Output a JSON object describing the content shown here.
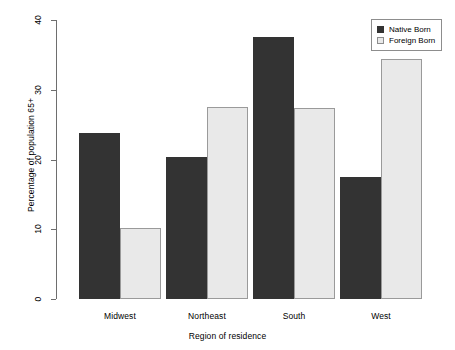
{
  "chart_data": {
    "type": "bar",
    "title": "",
    "subtitle": "",
    "xlabel": "Region of residence",
    "ylabel": "Percentage of population 65+",
    "categories": [
      "Midwest",
      "Northeast",
      "South",
      "West"
    ],
    "series": [
      {
        "name": "Native Born",
        "values": [
          23.8,
          20.3,
          37.6,
          17.5
        ],
        "color": "#333333"
      },
      {
        "name": "Foreign Born",
        "values": [
          10.2,
          27.6,
          27.4,
          34.4
        ],
        "color": "#e9e9e9"
      }
    ],
    "ylim": [
      0,
      40
    ],
    "yticks": [
      0,
      10,
      20,
      30,
      40
    ],
    "ytick_labels": [
      "0",
      "10",
      "20",
      "30",
      "40"
    ],
    "grid": false,
    "legend_position": "top-right",
    "legend_entries": [
      "Native Born",
      "Foreign Born"
    ]
  },
  "axes": {
    "y_title": "Percentage of population 65+",
    "x_title": "Region of residence"
  },
  "legend": {
    "items": [
      {
        "label": "Native Born"
      },
      {
        "label": "Foreign Born"
      }
    ]
  }
}
